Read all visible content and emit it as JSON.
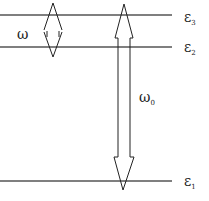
{
  "diagram": {
    "type": "energy-level-diagram",
    "levels": [
      {
        "name": "level-3",
        "label": "ε",
        "sub": "3",
        "y": 15
      },
      {
        "name": "level-2",
        "label": "ε",
        "sub": "2",
        "y": 47
      },
      {
        "name": "level-1",
        "label": "ε",
        "sub": "1",
        "y": 181
      }
    ],
    "transitions": [
      {
        "name": "omega",
        "label": "ω",
        "sub": "",
        "between": [
          "level-3",
          "level-2"
        ]
      },
      {
        "name": "omega-0",
        "label": "ω",
        "sub": "0",
        "between": [
          "level-3",
          "level-1"
        ]
      }
    ],
    "colors": {
      "line": "#555555",
      "arrow": "#222222",
      "text": "#222222"
    }
  }
}
